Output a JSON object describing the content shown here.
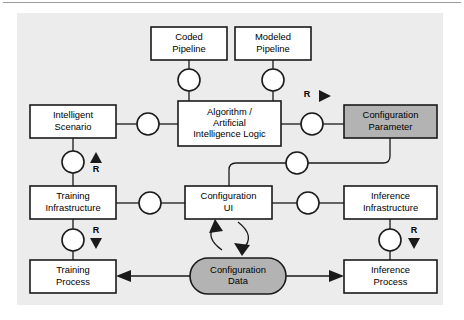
{
  "figure": {
    "panel": {
      "fill": "#ececec",
      "x": 17,
      "y": 13,
      "width": 426,
      "height": 292
    },
    "colors": {
      "box_fill": "#ffffff",
      "shaded_fill": "#b3b3b3",
      "stroke": "#1a1a1a",
      "page_bg": "#ffffff",
      "rule": "#9a9a9a"
    }
  },
  "nodes": [
    {
      "id": "coded-pipeline",
      "name": "coded-pipeline-box",
      "lines": [
        "Coded",
        "Pipeline"
      ],
      "shape": "rect",
      "shaded": false,
      "x": 151,
      "y": 27,
      "width": 76,
      "height": 33
    },
    {
      "id": "modeled-pipeline",
      "name": "modeled-pipeline-box",
      "lines": [
        "Modeled",
        "Pipeline"
      ],
      "shape": "rect",
      "shaded": false,
      "x": 235,
      "y": 27,
      "width": 76,
      "height": 33
    },
    {
      "id": "algorithm-ai-logic",
      "name": "algorithm-ai-logic-box",
      "lines": [
        "Algorithm /",
        "Artificial",
        "Intelligence Logic"
      ],
      "shape": "rect",
      "shaded": false,
      "x": 178,
      "y": 101,
      "width": 103,
      "height": 45
    },
    {
      "id": "intelligent-scenario",
      "name": "intelligent-scenario-box",
      "lines": [
        "Intelligent",
        "Scenario"
      ],
      "shape": "rect",
      "shaded": false,
      "x": 30,
      "y": 105,
      "width": 86,
      "height": 33
    },
    {
      "id": "configuration-parameter",
      "name": "configuration-parameter-box",
      "lines": [
        "Configuration",
        "Parameter"
      ],
      "shape": "rect",
      "shaded": true,
      "x": 344,
      "y": 105,
      "width": 93,
      "height": 33
    },
    {
      "id": "training-infrastructure",
      "name": "training-infrastructure-box",
      "lines": [
        "Training",
        "Infrastructure"
      ],
      "shape": "rect",
      "shaded": false,
      "x": 30,
      "y": 186,
      "width": 86,
      "height": 33
    },
    {
      "id": "configuration-ui",
      "name": "configuration-ui-box",
      "lines": [
        "Configuration",
        "UI"
      ],
      "shape": "rect",
      "shaded": false,
      "x": 185,
      "y": 186,
      "width": 87,
      "height": 33
    },
    {
      "id": "inference-infrastructure",
      "name": "inference-infrastructure-box",
      "lines": [
        "Inference",
        "Infrastructure"
      ],
      "shape": "rect",
      "shaded": false,
      "x": 344,
      "y": 186,
      "width": 93,
      "height": 33
    },
    {
      "id": "training-process",
      "name": "training-process-box",
      "lines": [
        "Training",
        "Process"
      ],
      "shape": "rect",
      "shaded": false,
      "x": 30,
      "y": 260,
      "width": 86,
      "height": 33
    },
    {
      "id": "configuration-data",
      "name": "configuration-data-store",
      "lines": [
        "Configuration",
        "Data"
      ],
      "shape": "stadium",
      "shaded": true,
      "x": 190,
      "y": 258,
      "width": 96,
      "height": 36
    },
    {
      "id": "inference-process",
      "name": "inference-process-box",
      "lines": [
        "Inference",
        "Process"
      ],
      "shape": "rect",
      "shaded": false,
      "x": 344,
      "y": 260,
      "width": 93,
      "height": 33
    }
  ],
  "ports": [
    {
      "id": "port-coded",
      "name": "port-circle-coded-pipeline",
      "cx": 189,
      "cy": 80,
      "r": 11
    },
    {
      "id": "port-modeled",
      "name": "port-circle-modeled-pipeline",
      "cx": 273,
      "cy": 80,
      "r": 11
    },
    {
      "id": "port-scenario-algo",
      "name": "port-circle-scenario-algorithm",
      "cx": 148,
      "cy": 124,
      "r": 11
    },
    {
      "id": "port-algo-param",
      "name": "port-circle-algorithm-parameter",
      "cx": 312,
      "cy": 124,
      "r": 11
    },
    {
      "id": "port-scenario-training",
      "name": "port-circle-scenario-training",
      "cx": 73,
      "cy": 162,
      "r": 11
    },
    {
      "id": "port-param-ui",
      "name": "port-circle-parameter-ui",
      "cx": 297,
      "cy": 163,
      "r": 11
    },
    {
      "id": "port-training-ui",
      "name": "port-circle-training-ui",
      "cx": 150,
      "cy": 203,
      "r": 11
    },
    {
      "id": "port-ui-inference",
      "name": "port-circle-ui-inference",
      "cx": 308,
      "cy": 203,
      "r": 11
    },
    {
      "id": "port-training-process",
      "name": "port-circle-training-process",
      "cx": 73,
      "cy": 240,
      "r": 11
    },
    {
      "id": "port-inference-process",
      "name": "port-circle-inference-process",
      "cx": 390,
      "cy": 240,
      "r": 11
    }
  ],
  "connectors": [
    {
      "id": "c-coded-port",
      "name": "connector-coded-pipeline-port",
      "d": "M 189 60 L 189 69"
    },
    {
      "id": "c-port-algo-1",
      "name": "connector-port-algorithm-coded",
      "d": "M 189 91 L 189 101"
    },
    {
      "id": "c-modeled-port",
      "name": "connector-modeled-pipeline-port",
      "d": "M 273 60 L 273 69"
    },
    {
      "id": "c-port-algo-2",
      "name": "connector-port-algorithm-modeled",
      "d": "M 273 91 L 273 101"
    },
    {
      "id": "c-scenario-port",
      "name": "connector-scenario-port",
      "d": "M 116 124 L 137 124"
    },
    {
      "id": "c-port-algo-3",
      "name": "connector-port-algorithm-left",
      "d": "M 159 124 L 178 124"
    },
    {
      "id": "c-algo-port",
      "name": "connector-algorithm-port-right",
      "d": "M 281 124 L 301 124"
    },
    {
      "id": "c-port-param",
      "name": "connector-port-configuration-parameter",
      "d": "M 323 124 L 344 124"
    },
    {
      "id": "c-scenario-down",
      "name": "connector-scenario-port-down",
      "d": "M 73 138 L 73 151"
    },
    {
      "id": "c-port-traininfra",
      "name": "connector-port-training-infrastructure",
      "d": "M 73 173 L 73 186"
    },
    {
      "id": "c-param-down",
      "name": "connector-parameter-down-to-port",
      "d": "M 390 138 L 390 156 Q 390 163 383 163 L 308 163"
    },
    {
      "id": "c-port-uitop",
      "name": "connector-port-to-configuration-ui-top",
      "d": "M 286 163 L 236 163 Q 229 163 229 170 L 229 186"
    },
    {
      "id": "c-traininfra-port",
      "name": "connector-training-infrastructure-port",
      "d": "M 116 203 L 139 203"
    },
    {
      "id": "c-port-ui-left",
      "name": "connector-port-configuration-ui-left",
      "d": "M 161 203 L 185 203"
    },
    {
      "id": "c-ui-port-right",
      "name": "connector-configuration-ui-port-right",
      "d": "M 272 203 L 297 203"
    },
    {
      "id": "c-port-infinfra",
      "name": "connector-port-inference-infrastructure",
      "d": "M 319 203 L 344 203"
    },
    {
      "id": "c-traininfra-down",
      "name": "connector-training-infrastructure-down",
      "d": "M 73 219 L 73 229"
    },
    {
      "id": "c-port-trainproc",
      "name": "connector-port-training-process",
      "d": "M 73 251 L 73 260"
    },
    {
      "id": "c-infinfra-down",
      "name": "connector-inference-infrastructure-down",
      "d": "M 390 219 L 390 229"
    },
    {
      "id": "c-port-infproc",
      "name": "connector-port-inference-process",
      "d": "M 390 251 L 390 260"
    },
    {
      "id": "c-data-trainproc",
      "name": "connector-configuration-data-training-process",
      "d": "M 190 276 L 124 276"
    },
    {
      "id": "c-data-infproc",
      "name": "connector-configuration-data-inference-process",
      "d": "M 286 276 L 336 276"
    },
    {
      "id": "c-ui-data-read",
      "name": "connector-configuration-ui-reads-data",
      "d": "M 222 250 Q 205 238 214 226"
    },
    {
      "id": "c-ui-data-write",
      "name": "connector-configuration-ui-writes-data",
      "d": "M 238 222 Q 256 236 243 249"
    }
  ],
  "arrowheads": [
    {
      "id": "a-trainproc",
      "name": "arrowhead-into-training-process",
      "points": "116,276 131,270 131,282",
      "direction": "left"
    },
    {
      "id": "a-infproc",
      "name": "arrowhead-into-inference-process",
      "points": "344,276 329,270 329,282",
      "direction": "right"
    },
    {
      "id": "a-ui-read",
      "name": "arrowhead-into-configuration-ui",
      "points": "215,219 209,233 223,231",
      "direction": "up"
    },
    {
      "id": "a-ui-write",
      "name": "arrowhead-into-configuration-data",
      "points": "242,256 234,243 250,245",
      "direction": "down"
    }
  ],
  "r_markers": [
    {
      "id": "r-parameter",
      "name": "r-marker-configuration-parameter",
      "label": "R",
      "label_x": 307,
      "label_y": 95,
      "triangle": "319,90 319,102 331,96",
      "direction": "right"
    },
    {
      "id": "r-scenario",
      "name": "r-marker-intelligent-scenario",
      "label": "R",
      "label_x": 96,
      "label_y": 170,
      "triangle": "96,152 90,163 102,163",
      "direction": "up"
    },
    {
      "id": "r-training",
      "name": "r-marker-training-infrastructure",
      "label": "R",
      "label_x": 96,
      "label_y": 231,
      "triangle": "90,238 102,238 96,249",
      "direction": "down"
    },
    {
      "id": "r-inference",
      "name": "r-marker-inference-infrastructure",
      "label": "R",
      "label_x": 414,
      "label_y": 231,
      "triangle": "408,238 420,238 414,249",
      "direction": "down"
    }
  ]
}
